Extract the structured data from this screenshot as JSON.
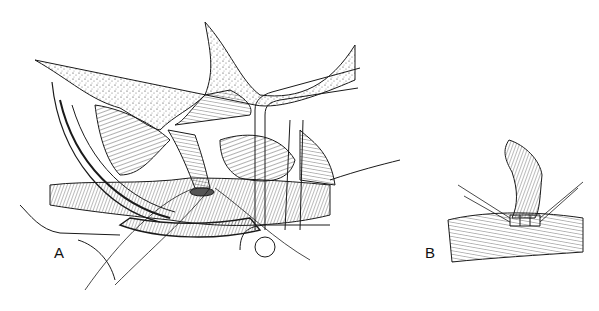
{
  "figure": {
    "panels": [
      {
        "id": "A",
        "label": "A"
      },
      {
        "id": "B",
        "label": "B"
      }
    ],
    "colors": {
      "ink": "#1a1a1a",
      "background": "#ffffff"
    }
  }
}
